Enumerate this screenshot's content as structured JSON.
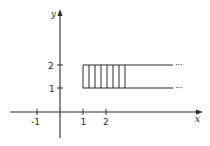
{
  "figure": {
    "axes": {
      "x_label": "x",
      "y_label": "y",
      "x_ticks": [
        {
          "value": -1,
          "label": "-1"
        },
        {
          "value": 1,
          "label": "1"
        },
        {
          "value": 2,
          "label": "2"
        }
      ],
      "y_ticks": [
        {
          "value": 1,
          "label": "1"
        },
        {
          "value": 2,
          "label": "2"
        }
      ]
    },
    "region": {
      "x_start": 1,
      "y_lower": 1,
      "y_upper": 2,
      "extends_right": true,
      "continuation_marker": "···",
      "hatch_lines": 8
    },
    "colors": {
      "ink": "#2a2a2a",
      "background": "#ffffff"
    }
  }
}
